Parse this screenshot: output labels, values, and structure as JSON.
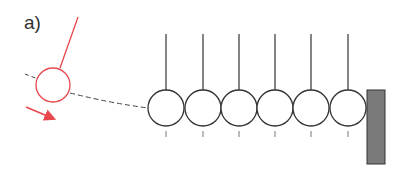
{
  "figure": {
    "label": "a)",
    "colors": {
      "red": "#e8474c",
      "ball_stroke": "#333333",
      "wall_fill": "#7a7a7a",
      "dash": "#444444"
    },
    "balls": {
      "count": 6,
      "centers_x": [
        166,
        203,
        239,
        275,
        311,
        348
      ],
      "center_y": 108,
      "radius": 18,
      "string_top_y": 34
    },
    "raised_ball": {
      "cx": 53,
      "cy": 85,
      "r": 17
    },
    "wall": {
      "x": 367,
      "y": 90,
      "width": 18,
      "height": 74
    }
  }
}
